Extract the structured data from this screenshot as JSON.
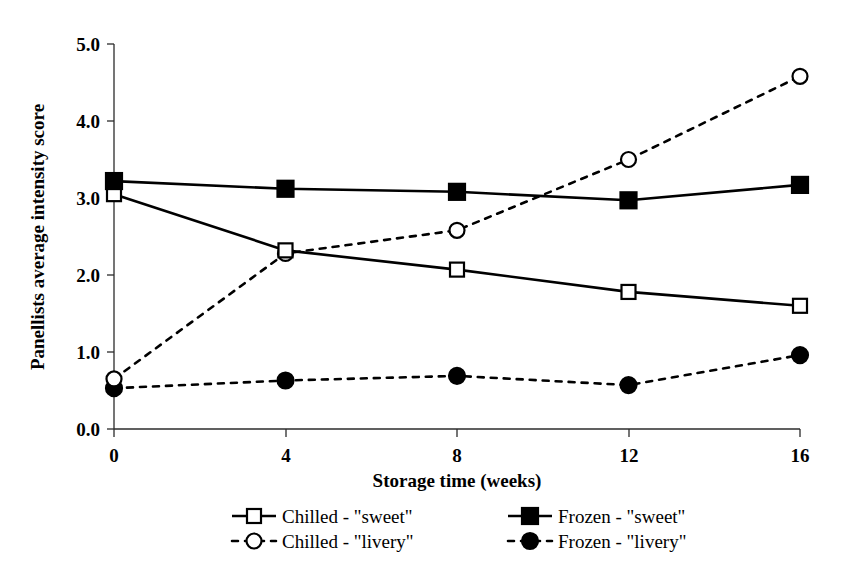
{
  "chart_data": {
    "type": "line",
    "title": "",
    "xlabel": "Storage time (weeks)",
    "ylabel": "Panellists average intensity score",
    "x": [
      0,
      4,
      8,
      12,
      16
    ],
    "xtick_labels": [
      "0",
      "4",
      "8",
      "12",
      "16"
    ],
    "ytick_labels": [
      "0.0",
      "1.0",
      "2.0",
      "3.0",
      "4.0",
      "5.0"
    ],
    "yticks": [
      0.0,
      1.0,
      2.0,
      3.0,
      4.0,
      5.0
    ],
    "xlim": [
      0,
      16
    ],
    "ylim": [
      0,
      5
    ],
    "grid": false,
    "legend_position": "bottom",
    "series": [
      {
        "name": "Chilled - \"sweet\"",
        "values": [
          3.05,
          2.32,
          2.07,
          1.78,
          1.6
        ],
        "marker": "open-square",
        "line": "solid",
        "color": "#000000"
      },
      {
        "name": "Frozen - \"sweet\"",
        "values": [
          3.22,
          3.12,
          3.08,
          2.97,
          3.17
        ],
        "marker": "filled-square",
        "line": "solid",
        "color": "#000000"
      },
      {
        "name": "Chilled - \"livery\"",
        "values": [
          0.65,
          2.28,
          2.58,
          3.5,
          4.58
        ],
        "marker": "open-circle",
        "line": "dashed",
        "color": "#000000"
      },
      {
        "name": "Frozen - \"livery\"",
        "values": [
          0.53,
          0.63,
          0.69,
          0.57,
          0.96
        ],
        "marker": "filled-circle",
        "line": "dashed",
        "color": "#000000"
      }
    ]
  },
  "axes": {
    "x_title": "Storage time (weeks)",
    "y_title": "Panellists average intensity score",
    "x_ticks": [
      "0",
      "4",
      "8",
      "12",
      "16"
    ],
    "y_ticks": [
      "5.0",
      "4.0",
      "3.0",
      "2.0",
      "1.0",
      "0.0"
    ]
  },
  "legend": {
    "entries": [
      {
        "label": "Chilled - \"sweet\"",
        "marker": "open-square",
        "line": "solid"
      },
      {
        "label": "Frozen - \"sweet\"",
        "marker": "filled-square",
        "line": "solid"
      },
      {
        "label": "Chilled - \"livery\"",
        "marker": "open-circle",
        "line": "dashed"
      },
      {
        "label": "Frozen - \"livery\"",
        "marker": "filled-circle",
        "line": "dashed"
      }
    ]
  },
  "style": {
    "foreground": "#000000",
    "axis_color": "#2b2b2b",
    "background": "#ffffff"
  }
}
